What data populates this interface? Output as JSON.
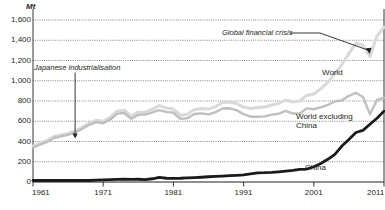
{
  "chart_data": {
    "type": "line",
    "title": "",
    "unit_label": "Mt",
    "xlabel": "",
    "ylabel": "Mt",
    "xlim": [
      1961,
      2011
    ],
    "ylim": [
      0,
      1600
    ],
    "grid": true,
    "legend_position": "inline-labels",
    "y_ticks": [
      "1,600",
      "1,400",
      "1,200",
      "1,000",
      "800",
      "600",
      "400",
      "200",
      "0"
    ],
    "y_tick_values": [
      1600,
      1400,
      1200,
      1000,
      800,
      600,
      400,
      200,
      0
    ],
    "x_ticks": [
      "1961",
      "1971",
      "1981",
      "1991",
      "2001",
      "2011"
    ],
    "x_tick_values": [
      1961,
      1971,
      1981,
      1991,
      2001,
      2011
    ],
    "x": [
      1961,
      1962,
      1963,
      1964,
      1965,
      1966,
      1967,
      1968,
      1969,
      1970,
      1971,
      1972,
      1973,
      1974,
      1975,
      1976,
      1977,
      1978,
      1979,
      1980,
      1981,
      1982,
      1983,
      1984,
      1985,
      1986,
      1987,
      1988,
      1989,
      1990,
      1991,
      1992,
      1993,
      1994,
      1995,
      1996,
      1997,
      1998,
      1999,
      2000,
      2001,
      2002,
      2003,
      2004,
      2005,
      2006,
      2007,
      2008,
      2009,
      2010,
      2011
    ],
    "series": [
      {
        "name": "World",
        "color": "#d9d9d9",
        "values": [
          355,
          385,
          410,
          450,
          465,
          480,
          505,
          540,
          580,
          610,
          600,
          640,
          700,
          710,
          650,
          690,
          690,
          720,
          755,
          730,
          720,
          660,
          670,
          715,
          725,
          720,
          745,
          785,
          790,
          775,
          740,
          725,
          735,
          740,
          760,
          775,
          810,
          790,
          800,
          855,
          870,
          920,
          985,
          1070,
          1160,
          1270,
          1370,
          1350,
          1240,
          1440,
          1530
        ]
      },
      {
        "name": "World excluding China",
        "color": "#bfbfbf",
        "values": [
          340,
          370,
          395,
          435,
          450,
          465,
          490,
          525,
          565,
          592,
          580,
          617,
          675,
          682,
          625,
          663,
          666,
          688,
          710,
          693,
          684,
          623,
          630,
          672,
          678,
          668,
          689,
          726,
          728,
          709,
          670,
          645,
          644,
          648,
          665,
          674,
          702,
          676,
          676,
          727,
          719,
          738,
          761,
          798,
          805,
          851,
          881,
          840,
          670,
          810,
          830
        ]
      },
      {
        "name": "China",
        "color": "#1a1a1a",
        "values": [
          15,
          15,
          15,
          15,
          15,
          15,
          15,
          15,
          15,
          18,
          20,
          23,
          25,
          28,
          25,
          27,
          24,
          32,
          45,
          37,
          36,
          37,
          40,
          43,
          47,
          52,
          56,
          59,
          62,
          66,
          70,
          80,
          91,
          92,
          95,
          101,
          108,
          114,
          124,
          128,
          151,
          182,
          224,
          272,
          355,
          419,
          489,
          510,
          570,
          630,
          700
        ]
      }
    ],
    "annotations": [
      {
        "id": "japanese-industrialisation",
        "text": "Japanese industrialisation",
        "style": "italic",
        "arrow": "down",
        "points_to_year": 1967,
        "points_to_value": 430
      },
      {
        "id": "global-financial-crisis",
        "text": "Global financial crisis",
        "style": "italic",
        "arrow": "right-down",
        "points_to_year": 2009,
        "points_to_value": 1240
      }
    ],
    "series_labels": [
      {
        "id": "world-label",
        "text": "World"
      },
      {
        "id": "world-excluding-china-label",
        "line1": "World excluding",
        "line2": "China"
      },
      {
        "id": "china-label",
        "text": "China"
      }
    ]
  }
}
